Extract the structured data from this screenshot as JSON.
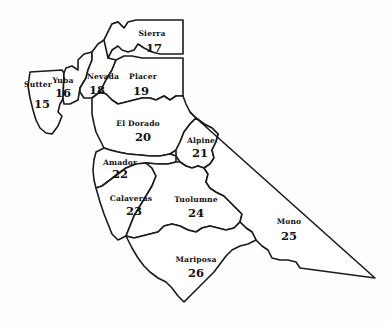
{
  "map": {
    "background_color": "#fefefe",
    "line_color": "#1a1a1a",
    "text_color": "#111111",
    "counties": [
      {
        "name": "Sutter",
        "number": "15",
        "name_x": 38,
        "name_y": 87,
        "number_x": 42,
        "number_y": 108,
        "path": "M 30 72 L 62 70 L 64 73 L 63 99 L 60 104 L 58 112 L 62 116 L 58 126 L 52 134 L 46 133 L 40 128 L 36 120 L 33 110 L 30 98 L 28 86 Z"
      },
      {
        "name": "Yuba",
        "number": "16",
        "name_x": 63,
        "name_y": 83,
        "number_x": 63,
        "number_y": 97,
        "path": "M 64 73 L 66 68 L 72 66 L 78 70 L 78 60 L 84 54 L 92 52 L 92 60 L 88 70 L 86 78 L 80 88 L 78 100 L 70 104 L 64 104 L 63 99 Z"
      },
      {
        "name": "Nevada",
        "number": "18",
        "name_x": 103,
        "name_y": 79,
        "number_x": 97,
        "number_y": 94,
        "path": "M 92 52 L 98 44 L 104 40 L 108 32 L 112 24 L 118 22 L 124 28 L 122 36 L 116 42 L 112 50 L 108 58 L 116 60 L 112 70 L 106 80 L 100 92 L 92 98 L 84 98 L 80 92 L 80 88 L 86 78 L 88 70 L 92 60 Z"
      },
      {
        "name": "Sierra",
        "number": "17",
        "name_x": 152,
        "name_y": 36,
        "number_x": 154,
        "number_y": 52,
        "path": "M 104 40 L 108 32 L 112 24 L 118 22 L 124 28 L 128 22 L 136 20 L 183 20 L 183 54 L 160 54 L 152 52 L 144 48 L 138 44 L 134 50 L 128 52 L 122 50 L 118 46 L 112 50 L 108 58 Z"
      },
      {
        "name": "Placer",
        "number": "19",
        "name_x": 143,
        "name_y": 79,
        "number_x": 141,
        "number_y": 95,
        "path": "M 116 60 L 124 56 L 132 56 L 142 58 L 183 58 L 183 70 L 183 96 L 176 96 L 170 100 L 164 96 L 156 100 L 150 98 L 142 98 L 134 100 L 126 102 L 118 104 L 112 100 L 106 94 L 100 92 L 106 80 L 112 70 Z"
      },
      {
        "name": "El Dorado",
        "number": "20",
        "name_x": 138,
        "name_y": 126,
        "number_x": 143,
        "number_y": 141,
        "path": "M 100 92 L 106 94 L 112 100 L 118 104 L 126 102 L 134 100 L 142 98 L 150 98 L 156 100 L 164 96 L 170 100 L 176 96 L 183 96 L 186 104 L 190 112 L 196 118 L 190 124 L 184 132 L 180 142 L 176 150 L 170 154 L 160 156 L 150 156 L 140 155 L 128 154 L 118 152 L 110 150 L 104 148 L 100 140 L 96 132 L 94 124 L 92 114 L 92 104 L 92 98 Z"
      },
      {
        "name": "Alpine",
        "number": "21",
        "name_x": 201,
        "name_y": 143,
        "number_x": 200,
        "number_y": 157,
        "path": "M 190 112 L 196 118 L 204 124 L 212 128 L 218 134 L 216 142 L 212 150 L 214 158 L 210 164 L 204 168 L 198 166 L 192 168 L 186 166 L 180 162 L 176 156 L 176 150 L 180 142 L 184 132 L 190 124 L 196 118 Z"
      },
      {
        "name": "Amador",
        "number": "22",
        "name_x": 120,
        "name_y": 165,
        "number_x": 120,
        "number_y": 178,
        "path": "M 96 152 L 104 148 L 110 150 L 118 152 L 128 154 L 140 155 L 150 156 L 160 156 L 170 154 L 176 156 L 176 162 L 168 164 L 158 164 L 146 163 L 136 164 L 126 168 L 118 174 L 110 180 L 102 186 L 96 188 L 94 180 L 93 170 L 94 160 Z"
      },
      {
        "name": "Calaveras",
        "number": "23",
        "name_x": 131,
        "name_y": 201,
        "number_x": 134,
        "number_y": 215,
        "path": "M 96 188 L 102 186 L 110 180 L 118 174 L 126 168 L 136 164 L 146 163 L 152 168 L 156 176 L 152 186 L 146 196 L 140 206 L 134 216 L 130 226 L 126 236 L 118 240 L 112 234 L 108 224 L 104 214 L 100 202 Z"
      },
      {
        "name": "Tuolumne",
        "number": "24",
        "name_x": 196,
        "name_y": 202,
        "number_x": 196,
        "number_y": 217,
        "path": "M 146 163 L 158 164 L 168 164 L 176 162 L 180 162 L 186 166 L 192 168 L 198 166 L 204 168 L 208 174 L 206 182 L 210 188 L 216 192 L 224 196 L 230 202 L 236 208 L 242 214 L 240 222 L 234 228 L 226 230 L 218 228 L 210 226 L 202 228 L 196 232 L 188 230 L 180 226 L 172 224 L 164 226 L 158 232 L 150 234 L 142 236 L 134 238 L 126 236 L 130 226 L 134 216 L 140 206 L 146 196 L 152 186 L 156 176 L 152 168 Z"
      },
      {
        "name": "Mono",
        "number": "25",
        "name_x": 289,
        "name_y": 224,
        "number_x": 289,
        "number_y": 240,
        "path": "M 196 118 L 204 124 L 212 128 L 218 134 L 216 142 L 212 150 L 214 158 L 210 164 L 204 168 L 208 174 L 206 182 L 210 188 L 216 192 L 224 196 L 230 202 L 236 208 L 242 214 L 240 222 L 246 228 L 252 232 L 256 240 L 262 246 L 268 250 L 272 258 L 280 260 L 288 260 L 296 262 L 300 268 L 375 278 L 196 118 Z"
      },
      {
        "name": "Mariposa",
        "number": "26",
        "name_x": 196,
        "name_y": 262,
        "number_x": 196,
        "number_y": 277,
        "path": "M 126 236 L 134 238 L 142 236 L 150 234 L 158 232 L 164 226 L 172 224 L 180 226 L 188 230 L 196 232 L 202 228 L 210 226 L 218 228 L 226 230 L 234 228 L 240 222 L 246 228 L 252 232 L 256 240 L 248 244 L 240 246 L 232 250 L 226 256 L 220 264 L 214 272 L 206 280 L 198 288 L 190 296 L 184 302 L 178 296 L 172 288 L 166 282 L 158 278 L 150 272 L 144 266 L 138 258 L 132 248 Z"
      }
    ]
  }
}
